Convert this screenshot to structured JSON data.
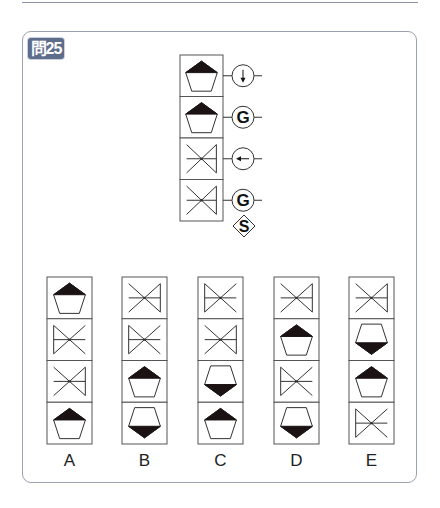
{
  "question": {
    "badge_label": "問25",
    "number": 25
  },
  "problem": {
    "cells": [
      "pentagon-top-filled",
      "pentagon-top-filled",
      "cross-right-bar",
      "cross-right-bar"
    ],
    "operators": [
      {
        "symbol": "↓",
        "type": "arrow-down-circle"
      },
      {
        "symbol": "G",
        "type": "letter-circle"
      },
      {
        "symbol": "←",
        "type": "arrow-left-circle"
      },
      {
        "symbol": "G",
        "type": "letter-circle"
      }
    ],
    "terminal": {
      "symbol": "S",
      "type": "diamond"
    }
  },
  "options": [
    {
      "label": "A",
      "cells": [
        "pentagon-top-filled",
        "cross-left-bar",
        "cross-right-bar",
        "pentagon-top-filled"
      ]
    },
    {
      "label": "B",
      "cells": [
        "cross-right-bar",
        "cross-left-bar",
        "pentagon-top-filled",
        "pentagon-bottom-filled"
      ]
    },
    {
      "label": "C",
      "cells": [
        "cross-left-bar",
        "cross-right-bar",
        "pentagon-bottom-filled",
        "pentagon-top-filled"
      ]
    },
    {
      "label": "D",
      "cells": [
        "cross-right-bar",
        "pentagon-top-filled",
        "cross-left-bar",
        "pentagon-bottom-filled"
      ]
    },
    {
      "label": "E",
      "cells": [
        "cross-right-bar",
        "pentagon-bottom-filled",
        "pentagon-top-filled",
        "cross-left-bar"
      ]
    }
  ],
  "colors": {
    "badge_bg": "#5e6d8c",
    "frame_border": "#9aa2b0",
    "stroke": "#333333",
    "fill": "#1a1213"
  }
}
